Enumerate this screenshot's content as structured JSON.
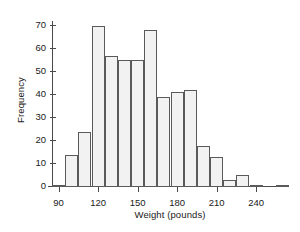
{
  "chart_data": {
    "type": "bar",
    "subtype": "histogram",
    "title": "",
    "xlabel": "Weight (pounds)",
    "ylabel": "Frequency",
    "bin_width": 10,
    "bin_starts": [
      85,
      95,
      105,
      115,
      125,
      135,
      145,
      155,
      165,
      175,
      185,
      195,
      205,
      215,
      225,
      235,
      255
    ],
    "bin_ends": [
      95,
      105,
      115,
      125,
      135,
      145,
      155,
      165,
      175,
      185,
      195,
      205,
      215,
      225,
      235,
      245,
      265
    ],
    "categories": [
      "85-95",
      "95-105",
      "105-115",
      "115-125",
      "125-135",
      "135-145",
      "145-155",
      "155-165",
      "165-175",
      "175-185",
      "185-195",
      "195-205",
      "205-215",
      "215-225",
      "225-235",
      "235-245",
      "255-265"
    ],
    "values": [
      1,
      14,
      24,
      70,
      57,
      55,
      55,
      68,
      39,
      41,
      42,
      18,
      13,
      3,
      5,
      1,
      1
    ],
    "xlim": [
      85,
      265
    ],
    "ylim": [
      0,
      72
    ],
    "xticks": [
      90,
      120,
      150,
      180,
      210,
      240
    ],
    "xtick_labels": [
      "90",
      "120",
      "150",
      "180",
      "210",
      "240"
    ],
    "yticks": [
      0,
      10,
      20,
      30,
      40,
      50,
      60,
      70
    ],
    "ytick_labels": [
      "0",
      "10",
      "20",
      "30",
      "40",
      "50",
      "60",
      "70"
    ],
    "grid": false,
    "legend": false,
    "bar_fill_color": "#f2f2f2",
    "bar_edge_color": "#5a5a5a",
    "axis_color": "#4a4a4a",
    "background_color": "#ffffff"
  }
}
